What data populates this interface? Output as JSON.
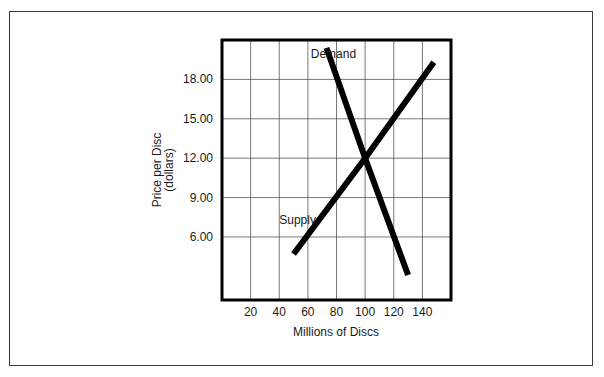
{
  "chart_data": {
    "type": "line",
    "title": "",
    "xlabel": "Millions of Discs",
    "ylabel": "Price per Disc",
    "ylabel_sub": "(dollars)",
    "xlim": [
      0,
      160
    ],
    "ylim": [
      1.2,
      21.0
    ],
    "grid": true,
    "legend": "inline labels",
    "x_ticks": [
      20,
      40,
      60,
      80,
      100,
      120,
      140
    ],
    "x_tick_labels": [
      "20",
      "40",
      "60",
      "80",
      "100",
      "120",
      "140"
    ],
    "y_ticks": [
      6,
      9,
      12,
      15,
      18
    ],
    "y_tick_labels": [
      "6.00",
      "9.00",
      "12.00",
      "15.00",
      "18.00"
    ],
    "series": [
      {
        "name": "Demand",
        "label": "Demand",
        "color": "#000000",
        "points": [
          [
            73,
            20.4
          ],
          [
            100,
            12.0
          ],
          [
            130,
            3.1
          ]
        ]
      },
      {
        "name": "Supply",
        "label": "Supply",
        "color": "#000000",
        "points": [
          [
            50,
            4.7
          ],
          [
            100,
            12.0
          ],
          [
            148,
            19.3
          ]
        ]
      }
    ],
    "annotations": [
      {
        "text": "Demand",
        "x": 62,
        "y": 19.6
      },
      {
        "text": "Supply",
        "x": 40,
        "y": 7.0
      }
    ],
    "equilibrium": {
      "x": 100,
      "y": 12.0
    }
  }
}
